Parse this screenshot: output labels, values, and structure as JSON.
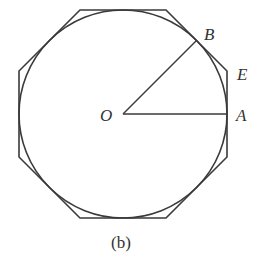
{
  "figure": {
    "caption": "(b)",
    "colors": {
      "stroke": "#3a3a3a",
      "text": "#333333",
      "background": "#ffffff"
    },
    "center": {
      "label": "O",
      "x": 123,
      "y": 114
    },
    "circle": {
      "radius": 104
    },
    "octagon": {
      "apothem": 104,
      "vertices": [
        [
          80,
          10
        ],
        [
          166,
          10
        ],
        [
          227,
          71
        ],
        [
          227,
          157
        ],
        [
          166,
          218
        ],
        [
          80,
          218
        ],
        [
          19,
          157
        ],
        [
          19,
          71
        ]
      ]
    },
    "points": [
      {
        "label": "A",
        "x": 227,
        "y": 114
      },
      {
        "label": "B",
        "x": 196.5,
        "y": 40.5
      },
      {
        "label": "E",
        "x": 227,
        "y": 71
      }
    ],
    "labels": {
      "O": "O",
      "A": "A",
      "B": "B",
      "E": "E"
    }
  }
}
